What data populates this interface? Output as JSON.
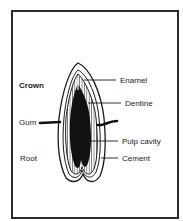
{
  "diagram": {
    "left_labels": [
      {
        "text": "Crown",
        "x": 19,
        "y": 82,
        "bold": true
      },
      {
        "text": "Gum",
        "x": 19,
        "y": 119,
        "bold": false
      },
      {
        "text": "Root",
        "x": 20,
        "y": 155,
        "bold": false
      }
    ],
    "right_labels": [
      {
        "text": "Enamel",
        "x": 120,
        "y": 77
      },
      {
        "text": "Dentine",
        "x": 125,
        "y": 100
      },
      {
        "text": "Pulp cavity",
        "x": 122,
        "y": 138
      },
      {
        "text": "Cement",
        "x": 122,
        "y": 155
      }
    ],
    "colors": {
      "ink": "#1a1a1a",
      "frame": "#2a2a2a",
      "background": "#ffffff"
    }
  }
}
